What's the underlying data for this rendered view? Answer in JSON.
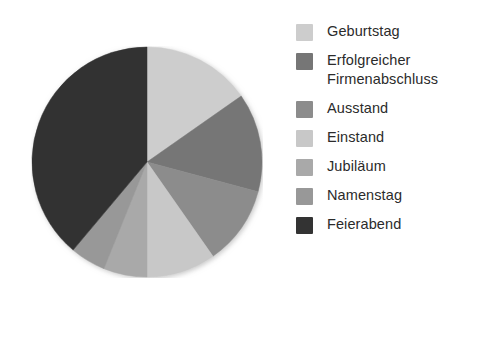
{
  "chart_data": {
    "type": "pie",
    "title": "",
    "subtitle": "",
    "xlabel": "",
    "ylabel": "",
    "grid": false,
    "legend_position": "right",
    "start_angle_deg": 0,
    "direction": "clockwise",
    "categories": [
      "Geburtstag",
      "Erfolgreicher Firmenabschluss",
      "Ausstand",
      "Einstand",
      "Jubiläum",
      "Namenstag",
      "Feierabend"
    ],
    "values": [
      15.3,
      13.9,
      11.1,
      9.7,
      6.1,
      5.0,
      38.9
    ],
    "angles_deg": [
      55,
      50,
      40,
      35,
      22,
      18,
      140
    ],
    "colors": [
      "#cdcdcd",
      "#767676",
      "#8c8c8c",
      "#c8c8c8",
      "#a9a9a9",
      "#989898",
      "#333333"
    ]
  },
  "legend": {
    "items": [
      {
        "label": "Geburtstag",
        "color": "#cdcdcd"
      },
      {
        "label": "Erfolgreicher\nFirmenabschluss",
        "color": "#767676"
      },
      {
        "label": "Ausstand",
        "color": "#8c8c8c"
      },
      {
        "label": "Einstand",
        "color": "#c8c8c8"
      },
      {
        "label": "Jubiläum",
        "color": "#a9a9a9"
      },
      {
        "label": "Namenstag",
        "color": "#989898"
      },
      {
        "label": "Feierabend",
        "color": "#333333"
      }
    ]
  }
}
